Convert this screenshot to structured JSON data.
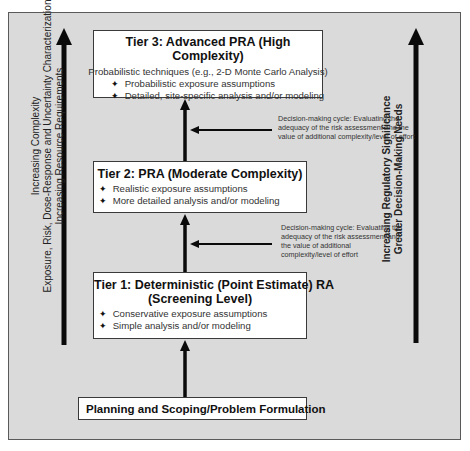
{
  "tiers": {
    "tier3": {
      "title": "Tier 3:  Advanced PRA (High Complexity)",
      "subtitle": "Probabilistic techniques (e.g., 2-D Monte Carlo Analysis)",
      "bullets": [
        "Probabilistic exposure assumptions",
        "Detailed, site-specific analysis and/or modeling"
      ]
    },
    "tier2": {
      "title": "Tier 2:  PRA (Moderate Complexity)",
      "bullets": [
        "Realistic exposure assumptions",
        "More detailed analysis and/or modeling"
      ]
    },
    "tier1": {
      "title_line1": "Tier 1:  Deterministic (Point Estimate) RA",
      "title_line2": "(Screening Level)",
      "bullets": [
        "Conservative exposure assumptions",
        "Simple analysis and/or modeling"
      ]
    },
    "planning": {
      "title": "Planning and Scoping/Problem Formulation"
    }
  },
  "bullet_glyph": "✦",
  "notes": {
    "upper": "Decision-making cycle:  Evaluating the adequacy of the risk assessment and the value of additional complexity/level of effort",
    "lower": "Decision-making cycle:  Evaluating the adequacy of the risk assessment and the value of additional complexity/level of effort"
  },
  "left_axis": {
    "line1": "Increasing Complexity",
    "line2": "Exposure, Risk, Dose-Response  and Uncertainty Characterization",
    "line3": "Increasing Resource Requirements"
  },
  "right_axis": {
    "line1": "Increasing Regulatory Significance",
    "line2": "Greater Decision-Making Needs"
  },
  "colors": {
    "frame_fill": "#dadada",
    "box_fill": "#ffffff",
    "arrow": "#0a0a0a"
  }
}
